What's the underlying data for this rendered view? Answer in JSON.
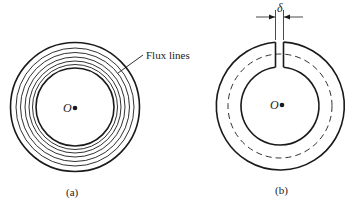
{
  "figure_a": {
    "caption": "(a)",
    "center_label": "O",
    "callout_label": "Flux lines",
    "center": [
      75,
      107
    ],
    "outer_radius": 64,
    "inner_radius": 39,
    "flux_line_count": 5
  },
  "figure_b": {
    "caption": "(b)",
    "center_label": "O",
    "gap_label": "δ",
    "center": [
      280,
      106
    ],
    "outer_radius": 64,
    "inner_radius": 39,
    "mean_path_radius": 52
  },
  "colors": {
    "line": "#1a1a1a",
    "background": "#ffffff"
  }
}
